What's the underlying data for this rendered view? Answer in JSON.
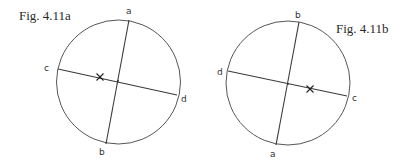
{
  "figures": [
    {
      "id": "a",
      "caption": "Fig. 4.11a",
      "caption_pos": [
        19,
        20
      ],
      "circle": {
        "cx": 118.5,
        "cy": 82,
        "r": 62
      },
      "chords": [
        {
          "name": "ab",
          "from": [
            129,
            20
          ],
          "to": [
            106,
            144
          ]
        },
        {
          "name": "cd",
          "from": [
            58,
            69
          ],
          "to": [
            177,
            95
          ]
        }
      ],
      "labels": [
        {
          "text": "a",
          "x": 126,
          "y": 14
        },
        {
          "text": "b",
          "x": 99,
          "y": 155
        },
        {
          "text": "c",
          "x": 44,
          "y": 71
        },
        {
          "text": "d",
          "x": 181,
          "y": 102
        }
      ],
      "intersection": [
        118,
        81
      ],
      "cross_mark": [
        100,
        77
      ]
    },
    {
      "id": "b",
      "caption": "Fig. 4.11b",
      "caption_pos": [
        336,
        33
      ],
      "circle": {
        "cx": 288,
        "cy": 83,
        "r": 62
      },
      "chords": [
        {
          "name": "ba",
          "from": [
            299,
            22
          ],
          "to": [
            276,
            145
          ]
        },
        {
          "name": "dc",
          "from": [
            228,
            71
          ],
          "to": [
            347,
            96
          ]
        }
      ],
      "labels": [
        {
          "text": "b",
          "x": 295,
          "y": 18
        },
        {
          "text": "a",
          "x": 270,
          "y": 157
        },
        {
          "text": "d",
          "x": 217,
          "y": 75
        },
        {
          "text": "c",
          "x": 352,
          "y": 101
        }
      ],
      "intersection": [
        288,
        84
      ],
      "cross_mark": [
        310,
        89
      ]
    }
  ]
}
